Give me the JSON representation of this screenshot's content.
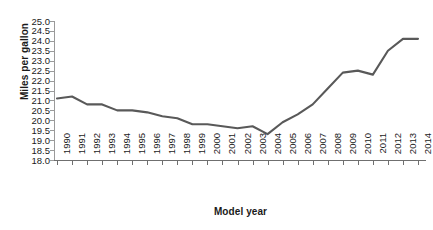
{
  "chart_data": {
    "type": "line",
    "title": "",
    "xlabel": "Model year",
    "ylabel": "Miles per gallon",
    "x": [
      1990,
      1991,
      1992,
      1993,
      1994,
      1995,
      1996,
      1997,
      1998,
      1999,
      2000,
      2001,
      2002,
      2003,
      2004,
      2005,
      2006,
      2007,
      2008,
      2009,
      2010,
      2011,
      2012,
      2013,
      2014
    ],
    "xtick_labels": [
      "1990",
      "1991",
      "1992",
      "1993",
      "1994",
      "1995",
      "1996",
      "1997",
      "1998",
      "1999",
      "2000",
      "2001",
      "2002",
      "2003",
      "2004",
      "2005",
      "2006",
      "2007",
      "2008",
      "2009",
      "2010",
      "2011",
      "2012",
      "2013",
      "2014"
    ],
    "values": [
      21.1,
      21.2,
      20.8,
      20.8,
      20.5,
      20.5,
      20.4,
      20.2,
      20.1,
      19.8,
      19.8,
      19.7,
      19.6,
      19.7,
      19.3,
      19.9,
      20.3,
      20.8,
      21.6,
      22.4,
      22.5,
      22.3,
      23.5,
      24.1,
      24.1
    ],
    "series": [
      {
        "name": "Miles per gallon",
        "values": [
          21.1,
          21.2,
          20.8,
          20.8,
          20.5,
          20.5,
          20.4,
          20.2,
          20.1,
          19.8,
          19.8,
          19.7,
          19.6,
          19.7,
          19.3,
          19.9,
          20.3,
          20.8,
          21.6,
          22.4,
          22.5,
          22.3,
          23.5,
          24.1,
          24.1
        ],
        "color": "#595959"
      }
    ],
    "ylim": [
      18.0,
      25.0
    ],
    "ytick_labels": [
      "25.0",
      "24.5",
      "24.0",
      "23.5",
      "23.0",
      "22.5",
      "22.0",
      "21.5",
      "21.0",
      "20.5",
      "20.0",
      "19.5",
      "19.0",
      "18.5",
      "18.0"
    ],
    "ytick_values": [
      25.0,
      24.5,
      24.0,
      23.5,
      23.0,
      22.5,
      22.0,
      21.5,
      21.0,
      20.5,
      20.0,
      19.5,
      19.0,
      18.5,
      18.0
    ],
    "grid": false,
    "legend": null,
    "legend_position": "none",
    "line_color": "#595959",
    "axis_color": "#6f6f6f"
  }
}
